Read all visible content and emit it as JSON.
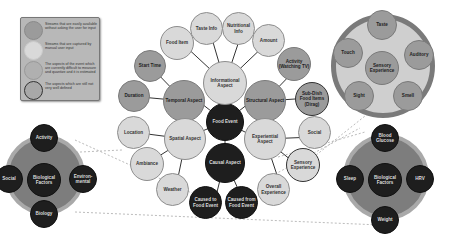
{
  "legend": {
    "items": [
      {
        "text": "Streams that are easily available without asking the user for input",
        "swatch": "#9b9b9b",
        "border": "#8a8a8a"
      },
      {
        "text": "Streams that are captured by manual user input",
        "swatch": "#d9d9d9",
        "border": "#cccccc"
      },
      {
        "text": "The aspects of the event which are currently difficult to measure and quantize and it is estimated",
        "swatch": "#b0b0b0",
        "border": "#999999"
      },
      {
        "text": "The aspects which are still not very well defined",
        "swatch": "#a8a8a8",
        "border": "#333333"
      }
    ]
  },
  "center": {
    "label": "Food Event"
  },
  "aspects": {
    "informational": "Informational Aspect",
    "temporal": "Temporal Aspect",
    "structural": "Structural Aspect",
    "spatial": "Spatial Aspect",
    "experiential": "Experiential Aspect",
    "causal": "Causal Aspect"
  },
  "leaves": {
    "food_item": "Food Item",
    "taste_info": "Taste Info",
    "nutritional_info": "Nutritional Info",
    "amount": "Amount",
    "activity_tv": "Activity (Watching TV)",
    "sub_dish": "Sub-Dish Food Items (Dirag)",
    "start_time": "Start Time",
    "duration": "Duration",
    "location": "Location",
    "ambiance": "Ambiance",
    "weather": "Weather",
    "social": "Social",
    "sensory_experience": "Sensory Experience",
    "overall_experience": "Overall Experience",
    "caused_to": "Caused to Food Event",
    "caused_from": "Caused from Food Event"
  },
  "sensory_panel": {
    "center": "Sensory Experience",
    "items": [
      "Taste",
      "Auditory",
      "Smell",
      "Sight",
      "Touch"
    ]
  },
  "bio_left_panel": {
    "center": "Biological Factors",
    "items": [
      "Activity",
      "Environ-mental",
      "Biology",
      "Social"
    ]
  },
  "bio_right_panel": {
    "center": "Biological Factors",
    "items": [
      "Blood Glucose",
      "HRV",
      "Weight",
      "Sleep"
    ]
  }
}
